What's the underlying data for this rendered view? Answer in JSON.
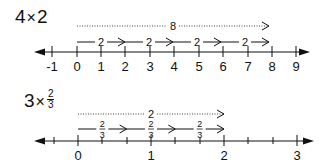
{
  "diagram": {
    "type": "number-line-multiplication",
    "colors": {
      "ink": "#111111",
      "secondary": "#333333"
    },
    "examples": [
      {
        "id": "top",
        "title": {
          "factor": "4",
          "operator": "×",
          "multiplicand": "2"
        },
        "axis": {
          "y": 52,
          "x_start": 34,
          "x_end": 310,
          "ticks": [
            {
              "label": "-1",
              "x": 52
            },
            {
              "label": "0",
              "x": 77
            },
            {
              "label": "1",
              "x": 101
            },
            {
              "label": "2",
              "x": 125
            },
            {
              "label": "3",
              "x": 150
            },
            {
              "label": "4",
              "x": 174
            },
            {
              "label": "5",
              "x": 199
            },
            {
              "label": "6",
              "x": 223
            },
            {
              "label": "7",
              "x": 248
            },
            {
              "label": "8",
              "x": 272
            },
            {
              "label": "9",
              "x": 296
            }
          ],
          "minor_ticks": []
        },
        "jumps": [
          {
            "label": "2",
            "from": "0",
            "to": "2"
          },
          {
            "label": "2",
            "from": "2",
            "to": "4"
          },
          {
            "label": "2",
            "from": "4",
            "to": "6"
          },
          {
            "label": "2",
            "from": "6",
            "to": "8"
          }
        ],
        "total": {
          "label": "8",
          "from": "0",
          "to": "8",
          "style": "dotted"
        }
      },
      {
        "id": "bottom",
        "title": {
          "factor": "3",
          "operator": "×",
          "numerator": "2",
          "denominator": "3"
        },
        "axis": {
          "y": 141,
          "x_start": 34,
          "x_end": 314,
          "ticks": [
            {
              "label": "0",
              "x": 78
            },
            {
              "label": "1",
              "x": 151
            },
            {
              "label": "2",
              "x": 224
            },
            {
              "label": "3",
              "x": 297
            }
          ],
          "minor_ticks": [
            54,
            102,
            127,
            175,
            200,
            248,
            273
          ]
        },
        "jumps": [
          {
            "numerator": "2",
            "denominator": "3",
            "from": "0",
            "to": "2/3"
          },
          {
            "numerator": "2",
            "denominator": "3",
            "from": "2/3",
            "to": "4/3"
          },
          {
            "numerator": "2",
            "denominator": "3",
            "from": "4/3",
            "to": "2"
          }
        ],
        "total": {
          "label": "2",
          "from": "0",
          "to": "2",
          "style": "dotted"
        }
      }
    ]
  }
}
